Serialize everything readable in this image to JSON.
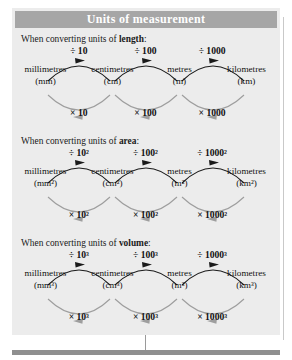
{
  "panel": {
    "title": "Units of measurement",
    "header_bg": "#a6a6a6",
    "panel_bg": "#ececec",
    "arrow_forward_color": "#1a1a1a",
    "arrow_back_color": "#9e9e9e"
  },
  "sections": [
    {
      "id": "length",
      "intro_prefix": "When converting units of ",
      "intro_keyword": "length",
      "intro_suffix": ":",
      "units": [
        {
          "name": "millimetres",
          "abbr": "(mm)"
        },
        {
          "name": "centimetres",
          "abbr": "(cm)"
        },
        {
          "name": "metres",
          "abbr": "(m)"
        },
        {
          "name": "kilometres",
          "abbr": "(km)"
        }
      ],
      "divide_factors": [
        "÷ 10",
        "÷ 100",
        "÷ 1000"
      ],
      "multiply_factors": [
        "× 10",
        "× 100",
        "× 1000"
      ]
    },
    {
      "id": "area",
      "intro_prefix": "When converting units of ",
      "intro_keyword": "area",
      "intro_suffix": ":",
      "units": [
        {
          "name": "millimetres",
          "abbr": "(mm²)"
        },
        {
          "name": "centimetres",
          "abbr": "(cm²)"
        },
        {
          "name": "metres",
          "abbr": "(m²)"
        },
        {
          "name": "kilometres",
          "abbr": "(km²)"
        }
      ],
      "divide_factors": [
        "÷ 10²",
        "÷ 100²",
        "÷ 1000²"
      ],
      "multiply_factors": [
        "× 10²",
        "× 100²",
        "× 1000²"
      ]
    },
    {
      "id": "volume",
      "intro_prefix": "When converting units of ",
      "intro_keyword": "volume",
      "intro_suffix": ":",
      "units": [
        {
          "name": "millimetres",
          "abbr": "(mm³)"
        },
        {
          "name": "centimetres",
          "abbr": "(cm³)"
        },
        {
          "name": "metres",
          "abbr": "(m³)"
        },
        {
          "name": "kilometres",
          "abbr": "(km³)"
        }
      ],
      "divide_factors": [
        "÷ 10³",
        "÷ 100³",
        "÷ 1000³"
      ],
      "multiply_factors": [
        "× 10³",
        "× 100³",
        "× 1000³"
      ]
    }
  ]
}
